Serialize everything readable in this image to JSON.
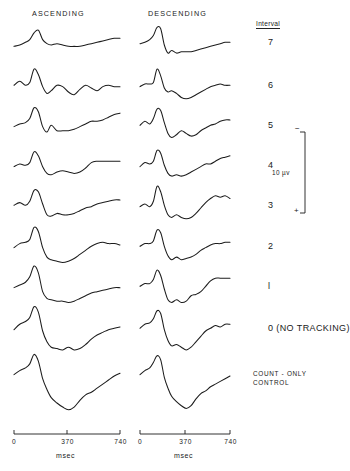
{
  "figure": {
    "columns": [
      {
        "id": "ascending",
        "label": "ASCENDING",
        "x_label": "msec"
      },
      {
        "id": "descending",
        "label": "DESCENDING",
        "x_label": "msec"
      }
    ],
    "interval_header": "Interval",
    "axis": {
      "ticks": [
        "0",
        "370",
        "740"
      ],
      "unit": "msec",
      "min_ms": 0,
      "max_ms": 740
    },
    "calibration": {
      "value": "10 µv",
      "top_sign": "−",
      "bottom_sign": "+"
    },
    "rows": [
      {
        "label": "7",
        "label_style": "normal"
      },
      {
        "label": "6",
        "label_style": "normal"
      },
      {
        "label": "5",
        "label_style": "normal"
      },
      {
        "label": "4",
        "label_style": "normal"
      },
      {
        "label": "3",
        "label_style": "normal"
      },
      {
        "label": "2",
        "label_style": "normal"
      },
      {
        "label": "l",
        "label_style": "normal"
      },
      {
        "label": "0  (NO  TRACKING)",
        "label_style": "normal"
      },
      {
        "label": "COUNT - ONLY\nCONTROL",
        "label_style": "small"
      }
    ]
  },
  "chart_data": {
    "type": "line",
    "title": "",
    "xlabel": "msec",
    "ylabel": "",
    "xlim": [
      0,
      740
    ],
    "grid": false,
    "legend": "none",
    "series_layout": "9 rows x 2 columns of averaged evoked-potential waveforms",
    "y_units": "microvolts (calibration bar = 10 µv, negative up)",
    "series": [
      {
        "name": "Interval 7 - ASCENDING",
        "row": "7",
        "column": "ascending",
        "x": [
          0,
          40,
          80,
          110,
          140,
          170,
          200,
          230,
          260,
          300,
          340,
          380,
          420,
          460,
          500,
          540,
          580,
          620,
          660,
          700,
          740
        ],
        "values": [
          -1,
          0,
          2,
          4,
          9,
          11,
          4,
          1,
          0,
          1,
          0,
          -1,
          -1,
          -1,
          0,
          1,
          2,
          3,
          4,
          5,
          5
        ]
      },
      {
        "name": "Interval 7 - DESCENDING",
        "row": "7",
        "column": "descending",
        "x": [
          0,
          40,
          80,
          110,
          140,
          170,
          200,
          230,
          260,
          300,
          340,
          380,
          420,
          460,
          500,
          540,
          580,
          620,
          660,
          700,
          740
        ],
        "values": [
          1,
          2,
          4,
          7,
          13,
          12,
          0,
          -6,
          -4,
          -6,
          -5,
          -5,
          -5,
          -4,
          -3,
          -2,
          -1,
          0,
          1,
          2,
          2
        ]
      },
      {
        "name": "Interval 6 - ASCENDING",
        "row": "6",
        "column": "ascending",
        "x": [
          0,
          40,
          80,
          110,
          140,
          170,
          200,
          230,
          260,
          300,
          340,
          380,
          420,
          460,
          500,
          540,
          580,
          620,
          660,
          700,
          740
        ],
        "values": [
          2,
          5,
          2,
          4,
          14,
          10,
          1,
          -4,
          -2,
          2,
          1,
          -3,
          -5,
          -1,
          2,
          0,
          -2,
          1,
          2,
          1,
          1
        ]
      },
      {
        "name": "Interval 6 - DESCENDING",
        "row": "6",
        "column": "descending",
        "x": [
          0,
          40,
          80,
          110,
          140,
          170,
          200,
          230,
          260,
          300,
          340,
          380,
          420,
          460,
          500,
          540,
          580,
          620,
          660,
          700,
          740
        ],
        "values": [
          1,
          3,
          3,
          4,
          14,
          9,
          0,
          -3,
          -2,
          -4,
          -7,
          -8,
          -7,
          -5,
          -3,
          -1,
          1,
          2,
          3,
          2,
          2
        ]
      },
      {
        "name": "Interval 5 - ASCENDING",
        "row": "5",
        "column": "ascending",
        "x": [
          0,
          40,
          80,
          110,
          140,
          170,
          200,
          230,
          260,
          300,
          340,
          380,
          420,
          460,
          500,
          540,
          580,
          620,
          660,
          700,
          740
        ],
        "values": [
          1,
          3,
          4,
          7,
          15,
          12,
          1,
          -3,
          2,
          -2,
          -2,
          -2,
          -1,
          1,
          3,
          5,
          5,
          6,
          8,
          10,
          11
        ]
      },
      {
        "name": "Interval 5 - DESCENDING",
        "row": "5",
        "column": "descending",
        "x": [
          0,
          40,
          80,
          110,
          140,
          170,
          200,
          230,
          260,
          300,
          340,
          380,
          420,
          460,
          500,
          540,
          580,
          620,
          660,
          700,
          740
        ],
        "values": [
          2,
          5,
          3,
          7,
          14,
          13,
          4,
          -4,
          -7,
          -5,
          -2,
          -4,
          -6,
          -5,
          -2,
          0,
          2,
          3,
          5,
          6,
          6
        ]
      },
      {
        "name": "Interval 4 - ASCENDING",
        "row": "4",
        "column": "ascending",
        "x": [
          0,
          40,
          80,
          110,
          140,
          170,
          200,
          230,
          260,
          300,
          340,
          380,
          420,
          460,
          500,
          540,
          580,
          620,
          660,
          700,
          740
        ],
        "values": [
          1,
          3,
          2,
          4,
          12,
          9,
          1,
          -4,
          -5,
          -3,
          -2,
          -3,
          -4,
          -3,
          0,
          4,
          5,
          5,
          5,
          5,
          5
        ]
      },
      {
        "name": "Interval 4 - DESCENDING",
        "row": "4",
        "column": "descending",
        "x": [
          0,
          40,
          80,
          110,
          140,
          170,
          200,
          230,
          260,
          300,
          340,
          380,
          420,
          460,
          500,
          540,
          580,
          620,
          660,
          700,
          740
        ],
        "values": [
          1,
          4,
          3,
          5,
          13,
          11,
          2,
          -4,
          -6,
          -5,
          -6,
          -5,
          -3,
          -1,
          1,
          3,
          3,
          5,
          7,
          8,
          9
        ]
      },
      {
        "name": "Interval 3 - ASCENDING",
        "row": "3",
        "column": "ascending",
        "x": [
          0,
          40,
          80,
          110,
          140,
          170,
          200,
          230,
          260,
          300,
          340,
          380,
          420,
          460,
          500,
          540,
          580,
          620,
          660,
          700,
          740
        ],
        "values": [
          2,
          4,
          2,
          5,
          13,
          12,
          3,
          -5,
          -6,
          -4,
          -5,
          -5,
          -4,
          -2,
          0,
          1,
          3,
          4,
          5,
          6,
          6
        ]
      },
      {
        "name": "Interval 3 - DESCENDING",
        "row": "3",
        "column": "descending",
        "x": [
          0,
          40,
          80,
          110,
          140,
          170,
          200,
          230,
          260,
          300,
          340,
          380,
          420,
          460,
          500,
          540,
          580,
          620,
          660,
          700,
          740
        ],
        "values": [
          1,
          3,
          1,
          5,
          16,
          12,
          2,
          -5,
          -7,
          -5,
          -7,
          -8,
          -7,
          -4,
          0,
          4,
          7,
          9,
          8,
          9,
          7
        ]
      },
      {
        "name": "Interval 2 - ASCENDING",
        "row": "2",
        "column": "ascending",
        "x": [
          0,
          40,
          80,
          110,
          140,
          170,
          200,
          230,
          260,
          300,
          340,
          380,
          420,
          460,
          500,
          540,
          580,
          620,
          660,
          700,
          740
        ],
        "values": [
          1,
          4,
          5,
          7,
          16,
          13,
          1,
          -6,
          -8,
          -9,
          -10,
          -9,
          -7,
          -4,
          -1,
          2,
          4,
          5,
          4,
          4,
          3
        ]
      },
      {
        "name": "Interval 2 - DESCENDING",
        "row": "2",
        "column": "descending",
        "x": [
          0,
          40,
          80,
          110,
          140,
          170,
          200,
          230,
          260,
          300,
          340,
          380,
          420,
          460,
          500,
          540,
          580,
          620,
          660,
          700,
          740
        ],
        "values": [
          2,
          4,
          4,
          6,
          14,
          12,
          2,
          -5,
          -8,
          -6,
          -8,
          -7,
          -6,
          -4,
          -1,
          1,
          3,
          4,
          4,
          5,
          5
        ]
      },
      {
        "name": "Interval l - ASCENDING",
        "row": "l",
        "column": "ascending",
        "x": [
          0,
          40,
          80,
          110,
          140,
          170,
          200,
          230,
          260,
          300,
          340,
          380,
          420,
          460,
          500,
          540,
          580,
          620,
          660,
          700,
          740
        ],
        "values": [
          1,
          3,
          5,
          9,
          17,
          12,
          -2,
          -7,
          -8,
          -9,
          -9,
          -10,
          -9,
          -7,
          -5,
          -3,
          -2,
          -1,
          0,
          1,
          1
        ]
      },
      {
        "name": "Interval l - DESCENDING",
        "row": "l",
        "column": "descending",
        "x": [
          0,
          40,
          80,
          110,
          140,
          170,
          200,
          230,
          260,
          300,
          340,
          380,
          420,
          460,
          500,
          540,
          580,
          620,
          660,
          700,
          740
        ],
        "values": [
          2,
          4,
          4,
          7,
          14,
          10,
          0,
          -8,
          -10,
          -8,
          -10,
          -9,
          -5,
          -4,
          -2,
          2,
          6,
          8,
          8,
          8,
          8
        ]
      },
      {
        "name": "Interval 0 (NO TRACKING) - ASCENDING",
        "row": "0  (NO  TRACKING)",
        "column": "ascending",
        "x": [
          0,
          40,
          80,
          110,
          140,
          170,
          200,
          230,
          260,
          300,
          340,
          380,
          420,
          460,
          500,
          540,
          580,
          620,
          660,
          700,
          740
        ],
        "values": [
          1,
          5,
          7,
          10,
          18,
          14,
          0,
          -8,
          -12,
          -13,
          -14,
          -12,
          -14,
          -13,
          -10,
          -6,
          -3,
          -1,
          1,
          2,
          3
        ]
      },
      {
        "name": "Interval 0 (NO TRACKING) - DESCENDING",
        "row": "0  (NO  TRACKING)",
        "column": "descending",
        "x": [
          0,
          40,
          80,
          110,
          140,
          170,
          200,
          230,
          260,
          300,
          340,
          380,
          420,
          460,
          500,
          540,
          580,
          620,
          660,
          700,
          740
        ],
        "values": [
          2,
          5,
          6,
          9,
          15,
          13,
          1,
          -7,
          -11,
          -10,
          -12,
          -14,
          -12,
          -8,
          -4,
          0,
          2,
          4,
          3,
          5,
          5
        ]
      },
      {
        "name": "COUNT - ONLY CONTROL - ASCENDING",
        "row": "COUNT - ONLY\nCONTROL",
        "column": "ascending",
        "x": [
          0,
          40,
          80,
          110,
          140,
          170,
          200,
          230,
          260,
          300,
          340,
          380,
          420,
          460,
          500,
          540,
          580,
          620,
          660,
          700,
          740
        ],
        "values": [
          1,
          4,
          6,
          9,
          16,
          11,
          -2,
          -10,
          -16,
          -20,
          -23,
          -25,
          -23,
          -18,
          -14,
          -12,
          -9,
          -6,
          -3,
          0,
          2
        ]
      },
      {
        "name": "COUNT - ONLY CONTROL - DESCENDING",
        "row": "COUNT - ONLY\nCONTROL",
        "column": "descending",
        "x": [
          0,
          40,
          80,
          110,
          140,
          170,
          200,
          230,
          260,
          300,
          340,
          380,
          420,
          460,
          500,
          540,
          580,
          620,
          660,
          700,
          740
        ],
        "values": [
          1,
          4,
          6,
          10,
          15,
          12,
          -1,
          -9,
          -15,
          -19,
          -22,
          -24,
          -22,
          -17,
          -13,
          -11,
          -8,
          -6,
          -4,
          -2,
          0
        ]
      }
    ]
  }
}
